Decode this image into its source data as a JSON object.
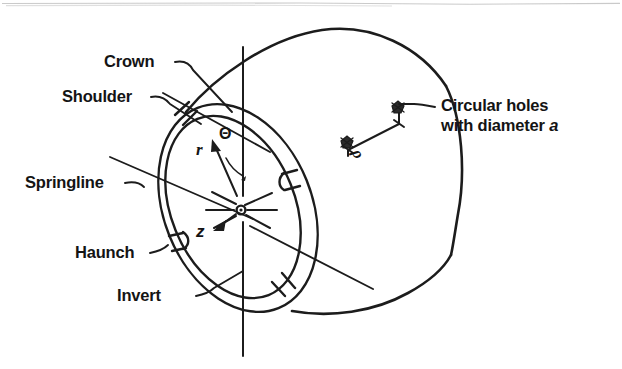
{
  "figure": {
    "type": "engineering-schematic",
    "background_color": "#ffffff",
    "ink_color": "#1c1c1c"
  },
  "labels": {
    "crown": "Crown",
    "shoulder": "Shoulder",
    "springline": "Springline",
    "haunch": "Haunch",
    "invert": "Invert",
    "holes_line1": "Circular holes",
    "holes_line2_prefix": "with diameter ",
    "holes_line2_symbol": "a"
  },
  "coordinate_system": {
    "radial_symbol": "r",
    "angular_symbol": "Θ",
    "axial_symbol": "z",
    "spacing_symbol": "ρ"
  },
  "annotations": [
    {
      "name": "crown",
      "text": "Crown",
      "target": "top of pipe ring"
    },
    {
      "name": "shoulder",
      "text": "Shoulder",
      "target": "upper-left of pipe ring"
    },
    {
      "name": "springline",
      "text": "Springline",
      "target": "mid-height of pipe ring"
    },
    {
      "name": "haunch",
      "text": "Haunch",
      "target": "lower-left of pipe ring"
    },
    {
      "name": "invert",
      "text": "Invert",
      "target": "bottom of pipe ring"
    },
    {
      "name": "circular-holes",
      "text": "Circular holes with diameter a",
      "target": "holes on pipe barrel"
    }
  ]
}
